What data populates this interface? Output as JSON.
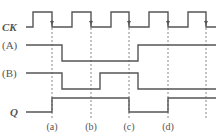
{
  "diagram": {
    "type": "timing-diagram",
    "colors": {
      "signal": "#555555",
      "dashed": "#888888",
      "text": "#555555",
      "background": "#ffffff"
    },
    "clock_label": "CK",
    "clock_edges_x": [
      52,
      91,
      129,
      168,
      206
    ],
    "signals": [
      {
        "label": "CK",
        "italic": true,
        "label_x": 2,
        "label_y": 31,
        "line_start": 26,
        "hi": 12,
        "lo": 27,
        "points": "26,27 33,27 33,12 52,12 52,27 72,27 72,12 91,12 91,27 111,27 111,12 129,12 129,27 149,27 149,12 168,12 168,27 188,27 188,12 206,12 206,27 216,27"
      },
      {
        "label": "(A)",
        "italic": false,
        "label_x": 2,
        "label_y": 49,
        "line_start": 26,
        "points": "26,45 62,45 62,61 138,61 138,45 216,45"
      },
      {
        "label": "(B)",
        "italic": false,
        "label_x": 2,
        "label_y": 77,
        "line_start": 26,
        "points": "26,73 62,73 62,89 100,89 100,73 138,73 138,89 216,89"
      },
      {
        "label": "Q",
        "italic": true,
        "label_x": 10,
        "label_y": 116,
        "line_start": 26,
        "points": "26,112 52,112 52,98 129,98 129,112 168,112 168,98 216,98"
      }
    ],
    "time_marks": [
      {
        "label": "(a)",
        "x": 52
      },
      {
        "label": "(b)",
        "x": 91
      },
      {
        "label": "(c)",
        "x": 129
      },
      {
        "label": "(d)",
        "x": 168
      }
    ]
  }
}
